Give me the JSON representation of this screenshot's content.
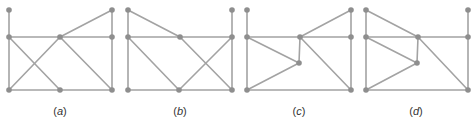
{
  "figure": {
    "colors": {
      "edge": "#a3a3a3",
      "node": "#8e8e8e",
      "label": "#333333"
    },
    "graphs": [
      {
        "id": "a",
        "label": "(a)",
        "label_x": 60,
        "nodes": [
          [
            9,
            10
          ],
          [
            9,
            37
          ],
          [
            60,
            37
          ],
          [
            112,
            10
          ],
          [
            112,
            37
          ],
          [
            9,
            90
          ],
          [
            60,
            90
          ],
          [
            112,
            90
          ]
        ],
        "edges": [
          [
            0,
            1
          ],
          [
            1,
            2
          ],
          [
            2,
            4
          ],
          [
            2,
            3
          ],
          [
            3,
            4
          ],
          [
            4,
            7
          ],
          [
            1,
            5
          ],
          [
            5,
            6
          ],
          [
            6,
            7
          ],
          [
            1,
            6
          ],
          [
            2,
            5
          ],
          [
            2,
            7
          ]
        ]
      },
      {
        "id": "b",
        "label": "(b)",
        "label_x": 180,
        "nodes": [
          [
            128,
            10
          ],
          [
            128,
            37
          ],
          [
            180,
            37
          ],
          [
            232,
            10
          ],
          [
            232,
            37
          ],
          [
            128,
            90
          ],
          [
            179,
            90
          ],
          [
            232,
            90
          ]
        ],
        "edges": [
          [
            0,
            1
          ],
          [
            0,
            2
          ],
          [
            1,
            2
          ],
          [
            2,
            4
          ],
          [
            3,
            4
          ],
          [
            4,
            7
          ],
          [
            1,
            5
          ],
          [
            5,
            6
          ],
          [
            6,
            7
          ],
          [
            1,
            6
          ],
          [
            2,
            7
          ],
          [
            4,
            6
          ]
        ]
      },
      {
        "id": "c",
        "label": "(c)",
        "label_x": 299,
        "nodes": [
          [
            247,
            10
          ],
          [
            247,
            37
          ],
          [
            300,
            37
          ],
          [
            351,
            10
          ],
          [
            351,
            37
          ],
          [
            299,
            63
          ],
          [
            247,
            90
          ],
          [
            351,
            90
          ]
        ],
        "edges": [
          [
            0,
            1
          ],
          [
            1,
            2
          ],
          [
            2,
            4
          ],
          [
            2,
            3
          ],
          [
            3,
            4
          ],
          [
            4,
            7
          ],
          [
            1,
            6
          ],
          [
            6,
            7
          ],
          [
            1,
            5
          ],
          [
            2,
            5
          ],
          [
            5,
            6
          ],
          [
            2,
            7
          ]
        ]
      },
      {
        "id": "d",
        "label": "(d)",
        "label_x": 416,
        "nodes": [
          [
            366,
            10
          ],
          [
            366,
            37
          ],
          [
            418,
            37
          ],
          [
            468,
            10
          ],
          [
            468,
            37
          ],
          [
            417,
            63
          ],
          [
            366,
            90
          ],
          [
            468,
            90
          ]
        ],
        "edges": [
          [
            0,
            1
          ],
          [
            0,
            2
          ],
          [
            1,
            2
          ],
          [
            2,
            4
          ],
          [
            3,
            4
          ],
          [
            4,
            7
          ],
          [
            1,
            6
          ],
          [
            6,
            7
          ],
          [
            1,
            5
          ],
          [
            2,
            5
          ],
          [
            5,
            6
          ],
          [
            2,
            7
          ]
        ]
      }
    ]
  }
}
